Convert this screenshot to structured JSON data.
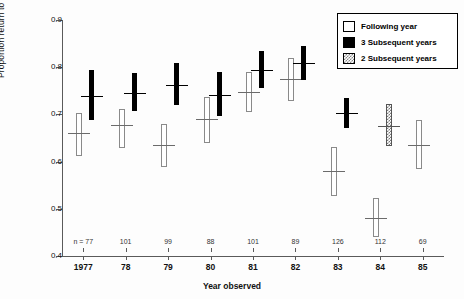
{
  "chart_data": {
    "type": "bar",
    "title": "",
    "xlabel": "Year observed",
    "ylabel": "Proportion return to pup",
    "ylim": [
      0.4,
      0.9
    ],
    "ytick_labels": [
      "0.9",
      "0.8",
      "0.7",
      "0.6",
      "0.5",
      "0.4"
    ],
    "ytick_values": [
      0.9,
      0.8,
      0.7,
      0.6,
      0.5,
      0.4
    ],
    "grid": false,
    "legend_position": "top-right",
    "categories": [
      "1977",
      "78",
      "79",
      "80",
      "81",
      "82",
      "83",
      "84",
      "85"
    ],
    "sample_size_prefix": "n = ",
    "sample_sizes": [
      77,
      101,
      99,
      88,
      101,
      89,
      126,
      112,
      69
    ],
    "series": [
      {
        "name": "Following year",
        "style": "open",
        "means": [
          0.66,
          0.678,
          0.635,
          0.69,
          0.748,
          0.775,
          0.58,
          0.48,
          0.635
        ],
        "lower": [
          0.612,
          0.628,
          0.588,
          0.64,
          0.705,
          0.728,
          0.528,
          0.44,
          0.585
        ],
        "upper": [
          0.702,
          0.712,
          0.68,
          0.737,
          0.79,
          0.82,
          0.63,
          0.522,
          0.688
        ]
      },
      {
        "name": "3 Subsequent years",
        "style": "filled",
        "means": [
          0.74,
          0.745,
          0.762,
          0.742,
          0.795,
          0.808,
          0.702,
          null,
          null
        ],
        "lower": [
          0.688,
          0.708,
          0.72,
          0.697,
          0.755,
          0.772,
          0.672,
          null,
          null
        ],
        "upper": [
          0.795,
          0.787,
          0.808,
          0.79,
          0.835,
          0.845,
          0.735,
          null,
          null
        ]
      },
      {
        "name": "2 Subsequent years",
        "style": "hatched",
        "means": [
          null,
          null,
          null,
          null,
          null,
          null,
          null,
          0.675,
          null
        ],
        "lower": [
          null,
          null,
          null,
          null,
          null,
          null,
          null,
          0.632,
          null
        ],
        "upper": [
          null,
          null,
          null,
          null,
          null,
          null,
          null,
          0.722,
          null
        ]
      }
    ],
    "legend_entries": [
      {
        "label": "Following year",
        "swatch": "open"
      },
      {
        "label": "3 Subsequent years",
        "swatch": "filled"
      },
      {
        "label": "2 Subsequent years",
        "swatch": "hatched"
      }
    ]
  }
}
